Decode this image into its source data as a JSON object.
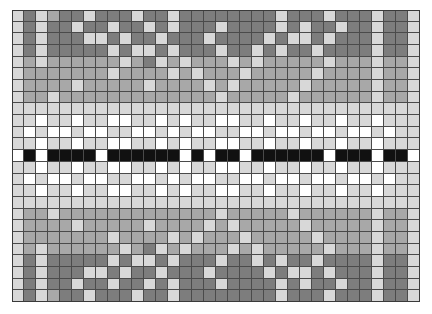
{
  "chart_data": {
    "type": "heatmap",
    "title": "",
    "subtitle": "",
    "xlabel": "",
    "ylabel": "",
    "xticklabels": [],
    "yticklabels": [],
    "grid": true,
    "legend": null,
    "annotations": [],
    "colormap": "grayscale",
    "value_levels": [
      0,
      1,
      2,
      3,
      4
    ],
    "level_colors": [
      "#111111",
      "#7d7d7d",
      "#a8a8a8",
      "#d8d8d8",
      "#ffffff"
    ],
    "ncols": 34,
    "nrows": 25,
    "vmin": 0,
    "vmax": 4,
    "symmetry": "mirrored about center row 12",
    "values": [
      [
        3,
        1,
        3,
        2,
        1,
        1,
        3,
        1,
        1,
        1,
        3,
        1,
        1,
        3,
        1,
        1,
        1,
        1,
        1,
        1,
        1,
        1,
        3,
        1,
        1,
        1,
        3,
        1,
        1,
        1,
        3,
        1,
        1,
        3
      ],
      [
        3,
        1,
        3,
        1,
        1,
        3,
        1,
        1,
        3,
        1,
        1,
        3,
        1,
        3,
        1,
        1,
        1,
        3,
        1,
        1,
        1,
        1,
        3,
        1,
        3,
        1,
        1,
        3,
        1,
        1,
        3,
        1,
        1,
        3
      ],
      [
        3,
        1,
        3,
        1,
        1,
        1,
        3,
        3,
        1,
        3,
        1,
        1,
        3,
        1,
        1,
        1,
        3,
        1,
        1,
        1,
        1,
        3,
        1,
        3,
        3,
        1,
        3,
        1,
        1,
        1,
        3,
        1,
        1,
        3
      ],
      [
        3,
        1,
        3,
        1,
        1,
        1,
        1,
        1,
        3,
        1,
        3,
        3,
        1,
        3,
        1,
        1,
        1,
        3,
        1,
        1,
        3,
        1,
        3,
        1,
        1,
        3,
        1,
        1,
        1,
        1,
        3,
        1,
        1,
        3
      ],
      [
        3,
        2,
        3,
        2,
        2,
        2,
        2,
        2,
        2,
        3,
        2,
        1,
        3,
        2,
        3,
        2,
        2,
        2,
        3,
        2,
        3,
        2,
        2,
        2,
        2,
        2,
        3,
        2,
        2,
        2,
        3,
        2,
        2,
        3
      ],
      [
        3,
        2,
        2,
        2,
        2,
        2,
        2,
        2,
        3,
        2,
        2,
        2,
        2,
        3,
        2,
        3,
        2,
        2,
        2,
        3,
        2,
        2,
        2,
        2,
        2,
        3,
        2,
        2,
        2,
        2,
        3,
        2,
        2,
        3
      ],
      [
        3,
        2,
        2,
        2,
        2,
        3,
        2,
        2,
        2,
        2,
        2,
        3,
        2,
        2,
        2,
        2,
        3,
        2,
        3,
        2,
        2,
        2,
        2,
        2,
        3,
        2,
        2,
        2,
        2,
        2,
        3,
        2,
        2,
        3
      ],
      [
        3,
        2,
        2,
        3,
        2,
        2,
        2,
        2,
        2,
        2,
        2,
        2,
        2,
        2,
        2,
        2,
        2,
        3,
        2,
        2,
        2,
        2,
        2,
        3,
        2,
        2,
        2,
        2,
        2,
        2,
        3,
        2,
        2,
        3
      ],
      [
        3,
        3,
        3,
        3,
        3,
        3,
        3,
        3,
        3,
        3,
        3,
        3,
        3,
        3,
        3,
        3,
        3,
        3,
        3,
        3,
        3,
        3,
        3,
        3,
        3,
        3,
        3,
        3,
        3,
        3,
        3,
        3,
        3,
        3
      ],
      [
        3,
        3,
        4,
        3,
        3,
        4,
        3,
        3,
        4,
        4,
        3,
        3,
        4,
        3,
        4,
        3,
        3,
        4,
        4,
        3,
        3,
        4,
        3,
        3,
        4,
        3,
        3,
        4,
        3,
        3,
        4,
        3,
        3,
        3
      ],
      [
        3,
        4,
        3,
        4,
        4,
        3,
        4,
        4,
        3,
        3,
        4,
        4,
        3,
        4,
        3,
        4,
        4,
        3,
        3,
        4,
        4,
        3,
        4,
        4,
        3,
        4,
        4,
        3,
        4,
        4,
        3,
        4,
        3,
        3
      ],
      [
        3,
        3,
        4,
        3,
        3,
        4,
        3,
        3,
        4,
        4,
        3,
        3,
        4,
        3,
        4,
        3,
        3,
        4,
        4,
        3,
        3,
        4,
        3,
        3,
        4,
        3,
        3,
        4,
        3,
        3,
        4,
        3,
        3,
        3
      ],
      [
        4,
        0,
        4,
        0,
        0,
        0,
        0,
        4,
        0,
        0,
        0,
        0,
        0,
        0,
        4,
        0,
        4,
        0,
        0,
        4,
        0,
        0,
        0,
        0,
        0,
        0,
        4,
        0,
        0,
        0,
        4,
        0,
        0,
        4
      ],
      [
        3,
        3,
        4,
        3,
        3,
        4,
        3,
        3,
        4,
        4,
        3,
        3,
        4,
        3,
        4,
        3,
        3,
        4,
        4,
        3,
        3,
        4,
        3,
        3,
        4,
        3,
        3,
        4,
        3,
        3,
        4,
        3,
        3,
        3
      ],
      [
        3,
        4,
        3,
        4,
        4,
        3,
        4,
        4,
        3,
        3,
        4,
        4,
        3,
        4,
        3,
        4,
        4,
        3,
        3,
        4,
        4,
        3,
        4,
        4,
        3,
        4,
        4,
        3,
        4,
        4,
        3,
        4,
        3,
        3
      ],
      [
        3,
        3,
        4,
        3,
        3,
        4,
        3,
        3,
        4,
        4,
        3,
        3,
        4,
        3,
        4,
        3,
        3,
        4,
        4,
        3,
        3,
        4,
        3,
        3,
        4,
        3,
        3,
        4,
        3,
        3,
        4,
        3,
        3,
        3
      ],
      [
        3,
        3,
        3,
        3,
        3,
        3,
        3,
        3,
        3,
        3,
        3,
        3,
        3,
        3,
        3,
        3,
        3,
        3,
        3,
        3,
        3,
        3,
        3,
        3,
        3,
        3,
        3,
        3,
        3,
        3,
        3,
        3,
        3,
        3
      ],
      [
        3,
        2,
        2,
        3,
        2,
        2,
        2,
        2,
        2,
        2,
        2,
        2,
        2,
        2,
        2,
        2,
        2,
        3,
        2,
        2,
        2,
        2,
        2,
        3,
        2,
        2,
        2,
        2,
        2,
        2,
        3,
        2,
        2,
        3
      ],
      [
        3,
        2,
        2,
        2,
        2,
        3,
        2,
        2,
        2,
        2,
        2,
        3,
        2,
        2,
        2,
        2,
        3,
        2,
        3,
        2,
        2,
        2,
        2,
        2,
        3,
        2,
        2,
        2,
        2,
        2,
        3,
        2,
        2,
        3
      ],
      [
        3,
        2,
        2,
        2,
        2,
        2,
        2,
        2,
        3,
        2,
        2,
        2,
        2,
        3,
        2,
        3,
        2,
        2,
        2,
        3,
        2,
        2,
        2,
        2,
        2,
        3,
        2,
        2,
        2,
        2,
        3,
        2,
        2,
        3
      ],
      [
        3,
        2,
        3,
        2,
        2,
        2,
        2,
        2,
        2,
        3,
        2,
        1,
        3,
        2,
        3,
        2,
        2,
        2,
        3,
        2,
        3,
        2,
        2,
        2,
        2,
        2,
        3,
        2,
        2,
        2,
        3,
        2,
        2,
        3
      ],
      [
        3,
        1,
        3,
        1,
        1,
        1,
        1,
        1,
        3,
        1,
        3,
        3,
        1,
        3,
        1,
        1,
        1,
        3,
        1,
        1,
        3,
        1,
        3,
        1,
        1,
        3,
        1,
        1,
        1,
        1,
        3,
        1,
        1,
        3
      ],
      [
        3,
        1,
        3,
        1,
        1,
        1,
        3,
        3,
        1,
        3,
        1,
        1,
        3,
        1,
        1,
        1,
        3,
        1,
        1,
        1,
        1,
        3,
        1,
        3,
        3,
        1,
        3,
        1,
        1,
        1,
        3,
        1,
        1,
        3
      ],
      [
        3,
        1,
        3,
        1,
        1,
        3,
        1,
        1,
        3,
        1,
        1,
        3,
        1,
        3,
        1,
        1,
        1,
        3,
        1,
        1,
        1,
        1,
        3,
        1,
        3,
        1,
        1,
        3,
        1,
        1,
        3,
        1,
        1,
        3
      ],
      [
        3,
        1,
        3,
        2,
        1,
        1,
        3,
        1,
        1,
        1,
        3,
        1,
        1,
        3,
        1,
        1,
        1,
        1,
        1,
        1,
        1,
        1,
        3,
        1,
        1,
        1,
        3,
        1,
        1,
        1,
        3,
        1,
        1,
        3
      ]
    ]
  }
}
